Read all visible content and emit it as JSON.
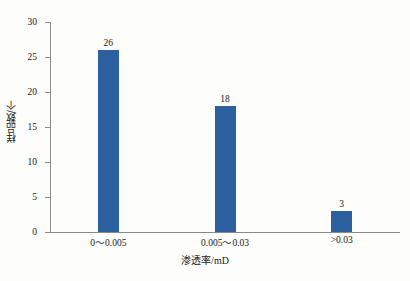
{
  "chart_data": {
    "type": "bar",
    "title": "",
    "subtitle": "",
    "xlabel": "渗透率/mD",
    "ylabel": "样品数/个",
    "categories": [
      "0〜0.005",
      "0.005〜0.03",
      ">0.03"
    ],
    "values": [
      26,
      18,
      3
    ],
    "value_labels": [
      "26",
      "18",
      "3"
    ],
    "ylim": [
      0,
      30
    ],
    "yticks": [
      0,
      5,
      10,
      15,
      20,
      25,
      30
    ],
    "ytick_labels": [
      "0",
      "5",
      "10",
      "15",
      "20",
      "25",
      "30"
    ],
    "grid": false,
    "legend": null,
    "legend_position": "none",
    "series": [
      {
        "name": "样品数",
        "values": [
          26,
          18,
          3
        ],
        "color": "#2c5f9e"
      }
    ],
    "colors": {
      "bar": "#2c5f9e",
      "axis": "#8a8a8a",
      "text": "#1a1a1a",
      "background": "#fdfdfb"
    }
  },
  "axis": {
    "y_title": "样品数/个",
    "x_title_text": "渗透率",
    "x_title_unit": "/mD"
  }
}
